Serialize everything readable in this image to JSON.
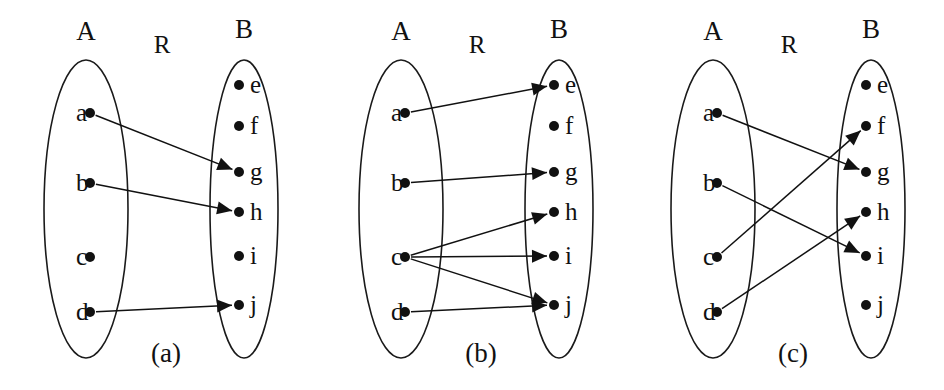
{
  "figure": {
    "background_color": "#ffffff",
    "ink_color": "#111111",
    "panel_count": 3,
    "panels": [
      {
        "caption": "(a)",
        "relation_label": "R",
        "domain_label": "A",
        "codomain_label": "B",
        "domain_nodes": [
          "a",
          "b",
          "c",
          "d"
        ],
        "codomain_nodes": [
          "e",
          "f",
          "g",
          "h",
          "i",
          "j"
        ],
        "edges": [
          {
            "from": "a",
            "to": "g"
          },
          {
            "from": "b",
            "to": "h"
          },
          {
            "from": "d",
            "to": "j"
          }
        ]
      },
      {
        "caption": "(b)",
        "relation_label": "R",
        "domain_label": "A",
        "codomain_label": "B",
        "domain_nodes": [
          "a",
          "b",
          "c",
          "d"
        ],
        "codomain_nodes": [
          "e",
          "f",
          "g",
          "h",
          "i",
          "j"
        ],
        "edges": [
          {
            "from": "a",
            "to": "e"
          },
          {
            "from": "b",
            "to": "g"
          },
          {
            "from": "c",
            "to": "h"
          },
          {
            "from": "c",
            "to": "i"
          },
          {
            "from": "c",
            "to": "j"
          },
          {
            "from": "d",
            "to": "j"
          }
        ]
      },
      {
        "caption": "(c)",
        "relation_label": "R",
        "domain_label": "A",
        "codomain_label": "B",
        "domain_nodes": [
          "a",
          "b",
          "c",
          "d"
        ],
        "codomain_nodes": [
          "e",
          "f",
          "g",
          "h",
          "i",
          "j"
        ],
        "edges": [
          {
            "from": "a",
            "to": "g"
          },
          {
            "from": "b",
            "to": "i"
          },
          {
            "from": "c",
            "to": "f"
          },
          {
            "from": "d",
            "to": "h"
          }
        ]
      }
    ],
    "geometry": {
      "panel_offsets": [
        0,
        315,
        627
      ],
      "left_ellipse": {
        "cx": 86,
        "cy": 209,
        "rx": 42,
        "ry": 149
      },
      "right_ellipse": {
        "cx": 244,
        "cy": 209,
        "rx": 34,
        "ry": 149
      },
      "domain_node_x": 90,
      "domain_node_y": [
        113,
        183,
        257,
        312
      ],
      "codomain_node_x": 239,
      "codomain_node_y": [
        85,
        126,
        172,
        212,
        256,
        305
      ],
      "set_label_a": {
        "x": 86,
        "y": 40
      },
      "set_label_b": {
        "x": 244,
        "y": 38
      },
      "rel_label": {
        "x": 162,
        "y": 53
      },
      "caption": {
        "x": 166,
        "y": 362
      },
      "dot_radius": 5
    }
  }
}
